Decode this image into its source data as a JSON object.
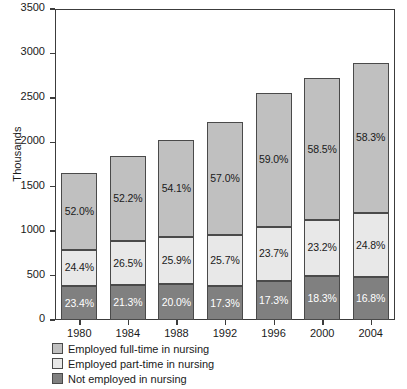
{
  "chart_data": {
    "type": "bar",
    "stacked": true,
    "title": "",
    "xlabel": "",
    "ylabel": "Thousands",
    "categories": [
      "1980",
      "1984",
      "1988",
      "1992",
      "1996",
      "2000",
      "2004"
    ],
    "ylim": [
      0,
      3500
    ],
    "yticks": [
      0,
      500,
      1000,
      1500,
      2000,
      2500,
      3000,
      3500
    ],
    "ytick_labels": [
      "0",
      "500",
      "1000",
      "1500",
      "2000",
      "2500",
      "3000",
      "3500"
    ],
    "grid": false,
    "legend_position": "bottom-left",
    "totals": [
      1660,
      1850,
      2030,
      2230,
      2560,
      2720,
      2900
    ],
    "series": [
      {
        "name": "Not employed in nursing",
        "color": "#808080",
        "stack_order": 0,
        "percent_labels": [
          "23.4%",
          "21.3%",
          "20.0%",
          "17.3%",
          "17.3%",
          "18.3%",
          "16.8%"
        ],
        "percents": [
          23.4,
          21.3,
          20.0,
          17.3,
          17.3,
          18.3,
          16.8
        ],
        "values": [
          388,
          394,
          406,
          386,
          443,
          498,
          487
        ]
      },
      {
        "name": "Employed part-time in nursing",
        "color": "#e8e8e8",
        "stack_order": 1,
        "percent_labels": [
          "24.4%",
          "26.5%",
          "25.9%",
          "25.7%",
          "23.7%",
          "23.2%",
          "24.8%"
        ],
        "percents": [
          24.4,
          26.5,
          25.9,
          25.7,
          23.7,
          23.2,
          24.8
        ],
        "values": [
          405,
          490,
          526,
          573,
          607,
          631,
          719
        ]
      },
      {
        "name": "Employed full-time in nursing",
        "color": "#c0c0c0",
        "stack_order": 2,
        "percent_labels": [
          "52.0%",
          "52.2%",
          "54.1%",
          "57.0%",
          "59.0%",
          "58.5%",
          "58.3%"
        ],
        "percents": [
          52.0,
          52.2,
          54.1,
          57.0,
          59.0,
          58.5,
          58.3
        ],
        "values": [
          863,
          966,
          1098,
          1271,
          1510,
          1591,
          1691
        ]
      }
    ]
  },
  "legend": {
    "items": [
      {
        "label": "Employed full-time in nursing",
        "color": "#c0c0c0"
      },
      {
        "label": "Employed part-time in nursing",
        "color": "#e8e8e8"
      },
      {
        "label": "Not employed in nursing",
        "color": "#808080"
      }
    ]
  }
}
